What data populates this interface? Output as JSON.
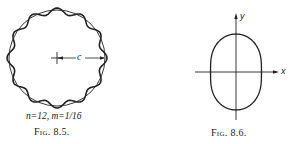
{
  "figures": [
    {
      "id": "fig-8-5",
      "caption": "Fig. 8.5.",
      "params": "n=12,  m=1/16",
      "dimension_label": "c",
      "n": 12,
      "m": "1/16",
      "description": "Circle of radius c with a superimposed wavy curve having 12 undulations"
    },
    {
      "id": "fig-8-6",
      "caption": "Fig. 8.6.",
      "axis_x_label": "x",
      "axis_y_label": "y",
      "description": "Peanut-shaped closed curve symmetric about the x and y axes"
    }
  ],
  "colors": {
    "ink": "#222222",
    "background": "#ffffff"
  }
}
